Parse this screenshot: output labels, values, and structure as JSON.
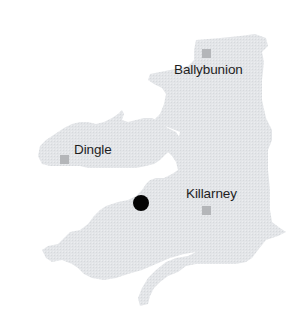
{
  "map": {
    "region": "County Kerry",
    "colors": {
      "land": "#e3e5e8",
      "land_texture": "#d7dadd",
      "town_marker": "#b4b6b9",
      "label": "#1e1e1e",
      "location_dot": "#050505",
      "background": "#ffffff"
    },
    "towns": [
      {
        "name": "Ballybunion",
        "icon": "square-town-marker"
      },
      {
        "name": "Dingle",
        "icon": "square-town-marker"
      },
      {
        "name": "Killarney",
        "icon": "square-town-marker"
      }
    ],
    "current_location": {
      "icon": "filled-circle-location-marker"
    }
  }
}
